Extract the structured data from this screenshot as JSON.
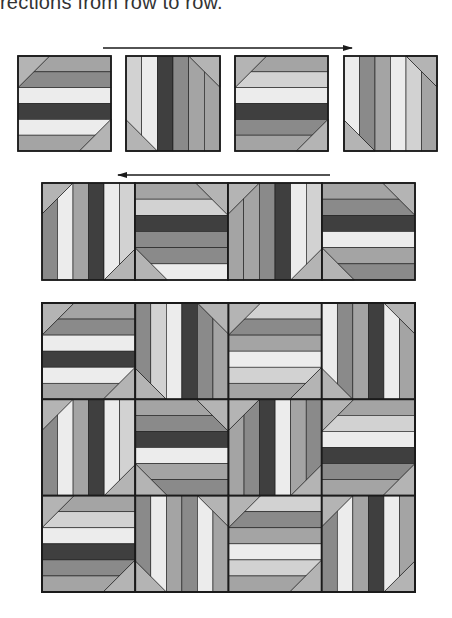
{
  "caption": "rections from row to row.",
  "palette": {
    "W": "#ececec",
    "L": "#d2d2d2",
    "M1": "#bdbdbd",
    "M2": "#a4a4a4",
    "M3": "#8a8a8a",
    "D": "#3f3f3f",
    "T": "#b4b4b4",
    "line": "#1a1a1a"
  },
  "arrows": [
    {
      "name": "arrow-right",
      "x1": 103,
      "x2": 352,
      "y": 48,
      "direction": "right"
    },
    {
      "name": "arrow-left",
      "x1": 118,
      "x2": 330,
      "y": 175,
      "direction": "left"
    }
  ],
  "patterns": {
    "H1": {
      "orient": "h",
      "tri": "tl-br",
      "stripes": [
        "M2",
        "M3",
        "W",
        "D",
        "W",
        "M2"
      ]
    },
    "H2": {
      "orient": "h",
      "tri": "tl-br",
      "stripes": [
        "M2",
        "L",
        "W",
        "D",
        "M3",
        "M2"
      ]
    },
    "H3": {
      "orient": "h",
      "tri": "tr-bl",
      "stripes": [
        "M2",
        "L",
        "D",
        "M3",
        "M3",
        "W"
      ]
    },
    "H4": {
      "orient": "h",
      "tri": "tr-bl",
      "stripes": [
        "M2",
        "M3",
        "D",
        "W",
        "M2",
        "M3"
      ]
    },
    "H5": {
      "orient": "h",
      "tri": "tl-br",
      "stripes": [
        "L",
        "M3",
        "M2",
        "W",
        "L",
        "M2"
      ]
    },
    "V1": {
      "orient": "v",
      "tri": "tr-bl",
      "stripes": [
        "L",
        "W",
        "D",
        "M3",
        "M2",
        "M2"
      ]
    },
    "V2": {
      "orient": "v",
      "tri": "tr-bl",
      "stripes": [
        "W",
        "M3",
        "M2",
        "W",
        "L",
        "M2"
      ]
    },
    "V3": {
      "orient": "v",
      "tri": "tl-br",
      "stripes": [
        "M3",
        "W",
        "M2",
        "D",
        "W",
        "L"
      ]
    },
    "V4": {
      "orient": "v",
      "tri": "tl-br",
      "stripes": [
        "M2",
        "M2",
        "M3",
        "D",
        "W",
        "L"
      ]
    },
    "V5": {
      "orient": "v",
      "tri": "tr-bl",
      "stripes": [
        "M3",
        "L",
        "W",
        "D",
        "M3",
        "M2"
      ]
    },
    "V6": {
      "orient": "v",
      "tri": "tr-bl",
      "stripes": [
        "W",
        "M3",
        "M2",
        "D",
        "W",
        "M2"
      ]
    },
    "V7": {
      "orient": "v",
      "tri": "tl-br",
      "stripes": [
        "M2",
        "M3",
        "D",
        "W",
        "M2",
        "M3"
      ]
    },
    "V8": {
      "orient": "v",
      "tri": "tr-bl",
      "stripes": [
        "M3",
        "W",
        "M2",
        "M3",
        "W",
        "M2"
      ]
    },
    "V9": {
      "orient": "v",
      "tri": "tl-br",
      "stripes": [
        "M3",
        "W",
        "M2",
        "D",
        "W",
        "M2"
      ]
    }
  },
  "row1": {
    "y": 56,
    "h": 95,
    "blocks": [
      {
        "x": 18,
        "w": 93,
        "pattern": "H1"
      },
      {
        "x": 126,
        "w": 94,
        "pattern": "V1"
      },
      {
        "x": 235,
        "w": 93,
        "pattern": "H2"
      },
      {
        "x": 344,
        "w": 93,
        "pattern": "V2"
      }
    ]
  },
  "row2": {
    "y": 183,
    "h": 97,
    "blocks": [
      {
        "x": 42,
        "w": 93,
        "pattern": "V3"
      },
      {
        "x": 135,
        "w": 93,
        "pattern": "H3"
      },
      {
        "x": 228,
        "w": 94,
        "pattern": "V4"
      },
      {
        "x": 322,
        "w": 93,
        "pattern": "H4"
      }
    ]
  },
  "quilt": {
    "x": 42,
    "y": 303,
    "w": 373,
    "h": 289,
    "rows": [
      [
        "H1",
        "V5",
        "H5",
        "V6"
      ],
      [
        "V3",
        "H4",
        "V7",
        "H2"
      ],
      [
        "H2",
        "V8",
        "H5",
        "V9"
      ]
    ]
  }
}
